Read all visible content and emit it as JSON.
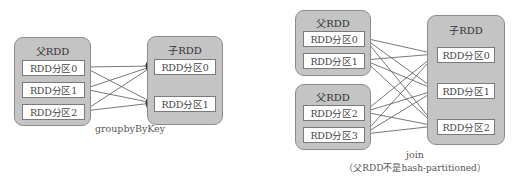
{
  "diagrams": {
    "groupby": {
      "parent": {
        "title": "父RDD",
        "partitions": [
          "RDD分区0",
          "RDD分区1",
          "RDD分区2"
        ]
      },
      "child": {
        "title": "子RDD",
        "partitions": [
          "RDD分区0",
          "RDD分区1"
        ]
      },
      "caption": "groupbyByKey",
      "edges": [
        {
          "from": 0,
          "to": 0
        },
        {
          "from": 0,
          "to": 1
        },
        {
          "from": 1,
          "to": 0
        },
        {
          "from": 1,
          "to": 1
        },
        {
          "from": 2,
          "to": 0
        },
        {
          "from": 2,
          "to": 1
        }
      ]
    },
    "join": {
      "parent1": {
        "title": "父RDD",
        "partitions": [
          "RDD分区0",
          "RDD分区1"
        ]
      },
      "parent2": {
        "title": "父RDD",
        "partitions": [
          "RDD分区2",
          "RDD分区3"
        ]
      },
      "child": {
        "title": "子RDD",
        "partitions": [
          "RDD分区0",
          "RDD分区1",
          "RDD分区2"
        ]
      },
      "caption_line1": "join",
      "caption_line2": "（父RDD不是hash-partitioned）",
      "edges": "each parent partition (0,1,2,3) connects to every child partition (0,1,2)"
    }
  },
  "colors": {
    "rdd_fill": "#c4c4c4",
    "rdd_border": "#8c8c8c",
    "partition_fill": "#ffffff",
    "edge": "#444444"
  }
}
